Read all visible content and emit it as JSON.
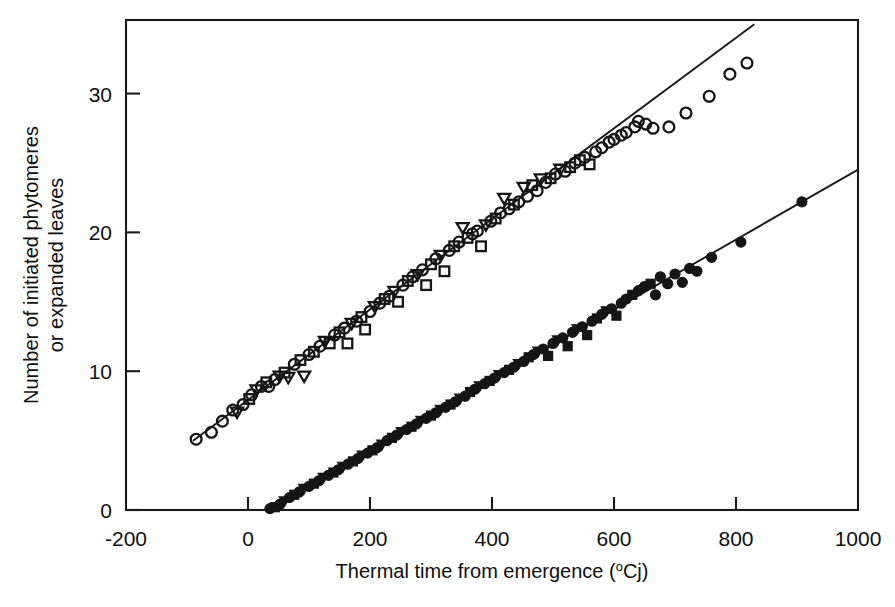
{
  "figure": {
    "background_color": "#fefefe",
    "ink_color": "#151515"
  },
  "axes": {
    "x": {
      "title_text": "Thermal time from emergence (",
      "title_sup": "o",
      "title_tail": "Cj)",
      "title_full": "Thermal time from emergence (oCj)",
      "ticks": [
        "-200",
        "0",
        "200",
        "400",
        "600",
        "800",
        "1000"
      ],
      "tick_values": [
        -200,
        0,
        200,
        400,
        600,
        800,
        1000
      ],
      "range": [
        -200,
        1000
      ]
    },
    "y": {
      "title_line1": "Number of initiated phytomeres",
      "title_line2": "or expanded leaves",
      "ticks": [
        "0",
        "10",
        "20",
        "30"
      ],
      "tick_values": [
        0,
        10,
        20,
        30
      ],
      "range": [
        0,
        35.3
      ]
    }
  },
  "chart_data": {
    "type": "scatter",
    "title": "",
    "xlabel": "Thermal time from emergence (oCj)",
    "ylabel": "Number of initiated phytomeres or expanded leaves",
    "xlim": [
      -200,
      1000
    ],
    "ylim": [
      0,
      35.3
    ],
    "grid": false,
    "legend": "none",
    "series": [
      {
        "name": "Initiated phytomeres",
        "marker": "open",
        "marker_shapes": [
          "circle",
          "square",
          "triangle-down"
        ],
        "fit_line": {
          "slope": 0.0326,
          "intercept": 7.93,
          "x_start": -90,
          "x_end": 830
        },
        "points": [
          {
            "x": -85,
            "y": 5.1,
            "m": "circle"
          },
          {
            "x": -60,
            "y": 5.6,
            "m": "circle"
          },
          {
            "x": -42,
            "y": 6.4,
            "m": "circle"
          },
          {
            "x": -25,
            "y": 7.2,
            "m": "circle"
          },
          {
            "x": -18,
            "y": 7.0,
            "m": "triangle-down"
          },
          {
            "x": -8,
            "y": 7.6,
            "m": "circle"
          },
          {
            "x": 2,
            "y": 8.0,
            "m": "square"
          },
          {
            "x": 6,
            "y": 8.3,
            "m": "circle"
          },
          {
            "x": 14,
            "y": 8.6,
            "m": "triangle-down"
          },
          {
            "x": 22,
            "y": 8.9,
            "m": "circle"
          },
          {
            "x": 30,
            "y": 9.2,
            "m": "square"
          },
          {
            "x": 34,
            "y": 8.9,
            "m": "circle"
          },
          {
            "x": 44,
            "y": 9.4,
            "m": "circle"
          },
          {
            "x": 52,
            "y": 9.6,
            "m": "triangle-down"
          },
          {
            "x": 60,
            "y": 9.9,
            "m": "square"
          },
          {
            "x": 66,
            "y": 9.5,
            "m": "triangle-down"
          },
          {
            "x": 76,
            "y": 10.5,
            "m": "circle"
          },
          {
            "x": 86,
            "y": 10.8,
            "m": "square"
          },
          {
            "x": 92,
            "y": 9.6,
            "m": "triangle-down"
          },
          {
            "x": 100,
            "y": 11.2,
            "m": "circle"
          },
          {
            "x": 108,
            "y": 11.4,
            "m": "square"
          },
          {
            "x": 118,
            "y": 11.8,
            "m": "circle"
          },
          {
            "x": 126,
            "y": 12.1,
            "m": "triangle-down"
          },
          {
            "x": 134,
            "y": 12.0,
            "m": "square"
          },
          {
            "x": 142,
            "y": 12.6,
            "m": "circle"
          },
          {
            "x": 150,
            "y": 12.8,
            "m": "square"
          },
          {
            "x": 158,
            "y": 13.1,
            "m": "circle"
          },
          {
            "x": 163,
            "y": 12.0,
            "m": "square"
          },
          {
            "x": 170,
            "y": 13.4,
            "m": "triangle-down"
          },
          {
            "x": 178,
            "y": 13.6,
            "m": "circle"
          },
          {
            "x": 186,
            "y": 13.9,
            "m": "square"
          },
          {
            "x": 192,
            "y": 13.0,
            "m": "square"
          },
          {
            "x": 200,
            "y": 14.3,
            "m": "circle"
          },
          {
            "x": 208,
            "y": 14.6,
            "m": "triangle-down"
          },
          {
            "x": 216,
            "y": 14.9,
            "m": "circle"
          },
          {
            "x": 224,
            "y": 15.2,
            "m": "square"
          },
          {
            "x": 232,
            "y": 15.4,
            "m": "circle"
          },
          {
            "x": 240,
            "y": 15.7,
            "m": "triangle-down"
          },
          {
            "x": 246,
            "y": 15.0,
            "m": "square"
          },
          {
            "x": 254,
            "y": 16.2,
            "m": "circle"
          },
          {
            "x": 262,
            "y": 16.5,
            "m": "square"
          },
          {
            "x": 270,
            "y": 16.8,
            "m": "circle"
          },
          {
            "x": 278,
            "y": 16.9,
            "m": "triangle-down"
          },
          {
            "x": 286,
            "y": 17.3,
            "m": "circle"
          },
          {
            "x": 292,
            "y": 16.2,
            "m": "square"
          },
          {
            "x": 300,
            "y": 17.7,
            "m": "square"
          },
          {
            "x": 308,
            "y": 18.1,
            "m": "circle"
          },
          {
            "x": 316,
            "y": 18.3,
            "m": "triangle-down"
          },
          {
            "x": 322,
            "y": 17.2,
            "m": "square"
          },
          {
            "x": 330,
            "y": 18.7,
            "m": "circle"
          },
          {
            "x": 338,
            "y": 19.0,
            "m": "square"
          },
          {
            "x": 346,
            "y": 19.3,
            "m": "circle"
          },
          {
            "x": 352,
            "y": 20.3,
            "m": "triangle-down"
          },
          {
            "x": 360,
            "y": 19.6,
            "m": "square"
          },
          {
            "x": 368,
            "y": 19.9,
            "m": "circle"
          },
          {
            "x": 376,
            "y": 20.1,
            "m": "circle"
          },
          {
            "x": 382,
            "y": 19.0,
            "m": "square"
          },
          {
            "x": 390,
            "y": 20.5,
            "m": "triangle-down"
          },
          {
            "x": 398,
            "y": 20.8,
            "m": "circle"
          },
          {
            "x": 406,
            "y": 21.0,
            "m": "square"
          },
          {
            "x": 414,
            "y": 21.4,
            "m": "circle"
          },
          {
            "x": 420,
            "y": 22.4,
            "m": "triangle-down"
          },
          {
            "x": 428,
            "y": 21.7,
            "m": "circle"
          },
          {
            "x": 436,
            "y": 22.0,
            "m": "square"
          },
          {
            "x": 444,
            "y": 22.2,
            "m": "circle"
          },
          {
            "x": 452,
            "y": 23.2,
            "m": "triangle-down"
          },
          {
            "x": 458,
            "y": 22.6,
            "m": "circle"
          },
          {
            "x": 466,
            "y": 23.4,
            "m": "square"
          },
          {
            "x": 474,
            "y": 23.0,
            "m": "circle"
          },
          {
            "x": 480,
            "y": 23.8,
            "m": "triangle-down"
          },
          {
            "x": 488,
            "y": 23.6,
            "m": "circle"
          },
          {
            "x": 496,
            "y": 23.9,
            "m": "square"
          },
          {
            "x": 504,
            "y": 24.2,
            "m": "circle"
          },
          {
            "x": 512,
            "y": 24.5,
            "m": "triangle-down"
          },
          {
            "x": 520,
            "y": 24.4,
            "m": "circle"
          },
          {
            "x": 528,
            "y": 24.7,
            "m": "square"
          },
          {
            "x": 536,
            "y": 25.0,
            "m": "circle"
          },
          {
            "x": 544,
            "y": 25.2,
            "m": "square"
          },
          {
            "x": 552,
            "y": 25.4,
            "m": "circle"
          },
          {
            "x": 560,
            "y": 24.9,
            "m": "square"
          },
          {
            "x": 570,
            "y": 25.8,
            "m": "circle"
          },
          {
            "x": 580,
            "y": 26.1,
            "m": "circle"
          },
          {
            "x": 592,
            "y": 26.5,
            "m": "circle"
          },
          {
            "x": 600,
            "y": 26.7,
            "m": "circle"
          },
          {
            "x": 612,
            "y": 27.0,
            "m": "circle"
          },
          {
            "x": 620,
            "y": 27.2,
            "m": "circle"
          },
          {
            "x": 634,
            "y": 27.6,
            "m": "circle"
          },
          {
            "x": 640,
            "y": 28.0,
            "m": "circle"
          },
          {
            "x": 652,
            "y": 27.8,
            "m": "circle"
          },
          {
            "x": 664,
            "y": 27.5,
            "m": "circle"
          },
          {
            "x": 690,
            "y": 27.6,
            "m": "circle"
          },
          {
            "x": 718,
            "y": 28.6,
            "m": "circle"
          },
          {
            "x": 756,
            "y": 29.8,
            "m": "circle"
          },
          {
            "x": 790,
            "y": 31.4,
            "m": "circle"
          },
          {
            "x": 818,
            "y": 32.2,
            "m": "circle"
          }
        ]
      },
      {
        "name": "Expanded leaves",
        "marker": "filled",
        "marker_shapes": [
          "circle",
          "square",
          "triangle-down"
        ],
        "fit_line": {
          "slope": 0.0252,
          "intercept": -0.68,
          "x_start": 28,
          "x_end": 1000
        },
        "points": [
          {
            "x": 36,
            "y": 0.1,
            "m": "circle"
          },
          {
            "x": 44,
            "y": 0.2,
            "m": "square"
          },
          {
            "x": 52,
            "y": 0.4,
            "m": "circle"
          },
          {
            "x": 60,
            "y": 0.6,
            "m": "triangle-down"
          },
          {
            "x": 68,
            "y": 0.9,
            "m": "circle"
          },
          {
            "x": 76,
            "y": 1.1,
            "m": "square"
          },
          {
            "x": 84,
            "y": 1.3,
            "m": "circle"
          },
          {
            "x": 92,
            "y": 1.5,
            "m": "triangle-down"
          },
          {
            "x": 100,
            "y": 1.7,
            "m": "circle"
          },
          {
            "x": 108,
            "y": 1.9,
            "m": "square"
          },
          {
            "x": 116,
            "y": 2.1,
            "m": "circle"
          },
          {
            "x": 124,
            "y": 2.3,
            "m": "triangle-down"
          },
          {
            "x": 132,
            "y": 2.5,
            "m": "circle"
          },
          {
            "x": 140,
            "y": 2.7,
            "m": "square"
          },
          {
            "x": 148,
            "y": 2.9,
            "m": "circle"
          },
          {
            "x": 156,
            "y": 3.1,
            "m": "triangle-down"
          },
          {
            "x": 164,
            "y": 3.3,
            "m": "circle"
          },
          {
            "x": 172,
            "y": 3.5,
            "m": "square"
          },
          {
            "x": 180,
            "y": 3.7,
            "m": "circle"
          },
          {
            "x": 188,
            "y": 3.9,
            "m": "triangle-down"
          },
          {
            "x": 196,
            "y": 4.1,
            "m": "circle"
          },
          {
            "x": 204,
            "y": 4.3,
            "m": "square"
          },
          {
            "x": 212,
            "y": 4.5,
            "m": "circle"
          },
          {
            "x": 220,
            "y": 4.7,
            "m": "triangle-down"
          },
          {
            "x": 228,
            "y": 5.0,
            "m": "circle"
          },
          {
            "x": 236,
            "y": 5.2,
            "m": "square"
          },
          {
            "x": 244,
            "y": 5.4,
            "m": "circle"
          },
          {
            "x": 252,
            "y": 5.6,
            "m": "triangle-down"
          },
          {
            "x": 260,
            "y": 5.8,
            "m": "circle"
          },
          {
            "x": 268,
            "y": 6.0,
            "m": "square"
          },
          {
            "x": 276,
            "y": 6.2,
            "m": "circle"
          },
          {
            "x": 284,
            "y": 6.4,
            "m": "triangle-down"
          },
          {
            "x": 292,
            "y": 6.6,
            "m": "circle"
          },
          {
            "x": 300,
            "y": 6.8,
            "m": "square"
          },
          {
            "x": 308,
            "y": 7.0,
            "m": "circle"
          },
          {
            "x": 316,
            "y": 7.2,
            "m": "triangle-down"
          },
          {
            "x": 324,
            "y": 7.4,
            "m": "circle"
          },
          {
            "x": 332,
            "y": 7.6,
            "m": "square"
          },
          {
            "x": 340,
            "y": 7.8,
            "m": "circle"
          },
          {
            "x": 348,
            "y": 8.0,
            "m": "triangle-down"
          },
          {
            "x": 356,
            "y": 8.2,
            "m": "circle"
          },
          {
            "x": 364,
            "y": 8.5,
            "m": "square"
          },
          {
            "x": 372,
            "y": 8.7,
            "m": "circle"
          },
          {
            "x": 380,
            "y": 8.9,
            "m": "triangle-down"
          },
          {
            "x": 388,
            "y": 9.1,
            "m": "circle"
          },
          {
            "x": 396,
            "y": 9.3,
            "m": "square"
          },
          {
            "x": 404,
            "y": 9.5,
            "m": "circle"
          },
          {
            "x": 412,
            "y": 9.7,
            "m": "triangle-down"
          },
          {
            "x": 420,
            "y": 9.9,
            "m": "circle"
          },
          {
            "x": 428,
            "y": 10.1,
            "m": "square"
          },
          {
            "x": 436,
            "y": 10.3,
            "m": "circle"
          },
          {
            "x": 444,
            "y": 10.5,
            "m": "triangle-down"
          },
          {
            "x": 452,
            "y": 10.7,
            "m": "circle"
          },
          {
            "x": 460,
            "y": 11.0,
            "m": "square"
          },
          {
            "x": 468,
            "y": 11.2,
            "m": "circle"
          },
          {
            "x": 476,
            "y": 11.4,
            "m": "triangle-down"
          },
          {
            "x": 484,
            "y": 11.6,
            "m": "circle"
          },
          {
            "x": 492,
            "y": 11.1,
            "m": "square"
          },
          {
            "x": 500,
            "y": 12.0,
            "m": "circle"
          },
          {
            "x": 508,
            "y": 12.2,
            "m": "triangle-down"
          },
          {
            "x": 516,
            "y": 12.4,
            "m": "circle"
          },
          {
            "x": 524,
            "y": 11.8,
            "m": "square"
          },
          {
            "x": 532,
            "y": 12.8,
            "m": "circle"
          },
          {
            "x": 540,
            "y": 13.0,
            "m": "triangle-down"
          },
          {
            "x": 548,
            "y": 13.2,
            "m": "circle"
          },
          {
            "x": 556,
            "y": 12.6,
            "m": "square"
          },
          {
            "x": 564,
            "y": 13.6,
            "m": "circle"
          },
          {
            "x": 572,
            "y": 13.8,
            "m": "square"
          },
          {
            "x": 580,
            "y": 14.1,
            "m": "circle"
          },
          {
            "x": 588,
            "y": 14.3,
            "m": "triangle-down"
          },
          {
            "x": 596,
            "y": 14.5,
            "m": "circle"
          },
          {
            "x": 604,
            "y": 14.0,
            "m": "square"
          },
          {
            "x": 612,
            "y": 14.9,
            "m": "circle"
          },
          {
            "x": 620,
            "y": 15.2,
            "m": "circle"
          },
          {
            "x": 630,
            "y": 15.5,
            "m": "square"
          },
          {
            "x": 640,
            "y": 15.8,
            "m": "circle"
          },
          {
            "x": 650,
            "y": 16.1,
            "m": "circle"
          },
          {
            "x": 660,
            "y": 16.3,
            "m": "square"
          },
          {
            "x": 668,
            "y": 15.5,
            "m": "circle"
          },
          {
            "x": 676,
            "y": 16.8,
            "m": "circle"
          },
          {
            "x": 688,
            "y": 16.3,
            "m": "circle"
          },
          {
            "x": 700,
            "y": 17.0,
            "m": "circle"
          },
          {
            "x": 712,
            "y": 16.4,
            "m": "circle"
          },
          {
            "x": 724,
            "y": 17.4,
            "m": "circle"
          },
          {
            "x": 736,
            "y": 17.2,
            "m": "circle"
          },
          {
            "x": 760,
            "y": 18.2,
            "m": "circle"
          },
          {
            "x": 808,
            "y": 19.3,
            "m": "circle"
          },
          {
            "x": 908,
            "y": 22.2,
            "m": "circle"
          }
        ]
      }
    ]
  }
}
